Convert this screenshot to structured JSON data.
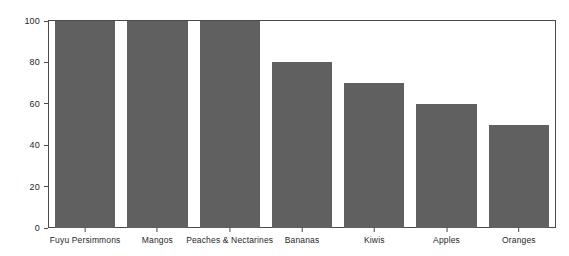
{
  "chart_data": {
    "type": "bar",
    "title": "",
    "subtitle": "",
    "xlabel": "",
    "ylabel": "",
    "categories": [
      "Fuyu Persimmons",
      "Mangos",
      "Peaches & Nectarines",
      "Bananas",
      "Kiwis",
      "Apples",
      "Oranges"
    ],
    "values": [
      100,
      100,
      100,
      80,
      70,
      60,
      50
    ],
    "ylim": [
      0,
      100
    ],
    "yticks": [
      0,
      20,
      40,
      60,
      80,
      100
    ],
    "ytick_labels": [
      "0",
      "20",
      "40",
      "60",
      "80",
      "100"
    ],
    "grid": false,
    "legend": null,
    "bar_color": "#606060",
    "axis_color": "#4a4a4a",
    "background_color": "#ffffff",
    "annotations": []
  }
}
